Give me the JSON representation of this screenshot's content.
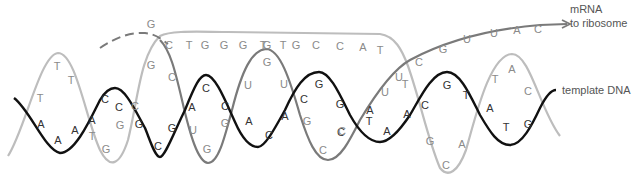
{
  "diagram": {
    "colors": {
      "coding_strand": "#b8b8b8",
      "template_strand": "#111111",
      "rna_strand": "#7a7a7a",
      "coding_text": "#8a8a8a",
      "template_text": "#333333",
      "rna_text": "#8a8a8a",
      "label_text": "#555555"
    },
    "labels": {
      "mrna_line1": "mRNA",
      "mrna_line2": "to ribosome",
      "template_dna": "template DNA"
    },
    "strands": {
      "coding_dna": {
        "name": "coding DNA strand (light grey)",
        "bases": [
          {
            "b": "T",
            "x": 40,
            "y": 98
          },
          {
            "b": "T",
            "x": 57,
            "y": 66
          },
          {
            "b": "T",
            "x": 71,
            "y": 80
          },
          {
            "b": "T",
            "x": 92,
            "y": 136
          },
          {
            "b": "G",
            "x": 106,
            "y": 149
          },
          {
            "b": "G",
            "x": 120,
            "y": 125
          },
          {
            "b": "C",
            "x": 135,
            "y": 106
          },
          {
            "b": "G",
            "x": 151,
            "y": 65
          },
          {
            "b": "G",
            "x": 151,
            "y": 24
          }
        ]
      },
      "template_dna": {
        "name": "template DNA strand (black)",
        "bases": [
          {
            "b": "A",
            "x": 41,
            "y": 124
          },
          {
            "b": "A",
            "x": 58,
            "y": 140
          },
          {
            "b": "A",
            "x": 75,
            "y": 130
          },
          {
            "b": "A",
            "x": 92,
            "y": 120
          },
          {
            "b": "C",
            "x": 105,
            "y": 99
          },
          {
            "b": "C",
            "x": 119,
            "y": 107
          },
          {
            "b": "G",
            "x": 139,
            "y": 124
          },
          {
            "b": "C",
            "x": 158,
            "y": 146
          },
          {
            "b": "G",
            "x": 172,
            "y": 128
          },
          {
            "b": "A",
            "x": 192,
            "y": 107
          },
          {
            "b": "C",
            "x": 206,
            "y": 88
          },
          {
            "b": "C",
            "x": 225,
            "y": 106
          },
          {
            "b": "A",
            "x": 249,
            "y": 121
          },
          {
            "b": "C",
            "x": 269,
            "y": 135
          },
          {
            "b": "A",
            "x": 285,
            "y": 116
          },
          {
            "b": "C",
            "x": 304,
            "y": 99
          },
          {
            "b": "G",
            "x": 319,
            "y": 84
          },
          {
            "b": "G",
            "x": 340,
            "y": 104
          },
          {
            "b": "C",
            "x": 341,
            "y": 132
          },
          {
            "b": "A",
            "x": 370,
            "y": 110
          },
          {
            "b": "T",
            "x": 369,
            "y": 121
          },
          {
            "b": "A",
            "x": 387,
            "y": 131
          },
          {
            "b": "A",
            "x": 407,
            "y": 114
          },
          {
            "b": "C",
            "x": 425,
            "y": 105
          },
          {
            "b": "G",
            "x": 447,
            "y": 85
          },
          {
            "b": "T",
            "x": 466,
            "y": 95
          },
          {
            "b": "A",
            "x": 490,
            "y": 108
          },
          {
            "b": "T",
            "x": 506,
            "y": 127
          },
          {
            "b": "G",
            "x": 528,
            "y": 124
          }
        ]
      },
      "rna_in_bubble": {
        "name": "RNA strand paired with template (medium grey)",
        "bases": [
          {
            "b": "C",
            "x": 172,
            "y": 77
          },
          {
            "b": "U",
            "x": 193,
            "y": 130
          },
          {
            "b": "G",
            "x": 207,
            "y": 149
          },
          {
            "b": "G",
            "x": 225,
            "y": 123
          },
          {
            "b": "U",
            "x": 248,
            "y": 85
          },
          {
            "b": "G",
            "x": 267,
            "y": 62
          },
          {
            "b": "U",
            "x": 284,
            "y": 84
          },
          {
            "b": "G",
            "x": 307,
            "y": 121
          },
          {
            "b": "C",
            "x": 323,
            "y": 150
          },
          {
            "b": "C",
            "x": 342,
            "y": 131
          },
          {
            "b": "U",
            "x": 385,
            "y": 92
          },
          {
            "b": "U",
            "x": 399,
            "y": 77
          },
          {
            "b": "T",
            "x": 405,
            "y": 84
          }
        ]
      },
      "coding_top": {
        "name": "non-template DNA strand running across top",
        "bases": [
          {
            "b": "C",
            "x": 169,
            "y": 45
          },
          {
            "b": "T",
            "x": 189,
            "y": 45
          },
          {
            "b": "G",
            "x": 205,
            "y": 45
          },
          {
            "b": "G",
            "x": 224,
            "y": 45
          },
          {
            "b": "G",
            "x": 243,
            "y": 45
          },
          {
            "b": "T",
            "x": 263,
            "y": 45
          },
          {
            "b": "G",
            "x": 267,
            "y": 45
          },
          {
            "b": "T",
            "x": 283,
            "y": 45
          },
          {
            "b": "G",
            "x": 296,
            "y": 45
          },
          {
            "b": "C",
            "x": 316,
            "y": 45
          },
          {
            "b": "C",
            "x": 340,
            "y": 46
          },
          {
            "b": "A",
            "x": 363,
            "y": 47
          },
          {
            "b": "T",
            "x": 380,
            "y": 50
          }
        ]
      },
      "mrna_exit": {
        "name": "mRNA leaving toward ribosome",
        "bases": [
          {
            "b": "C",
            "x": 419,
            "y": 62
          },
          {
            "b": "G",
            "x": 443,
            "y": 49
          },
          {
            "b": "U",
            "x": 467,
            "y": 39
          },
          {
            "b": "U",
            "x": 494,
            "y": 33
          },
          {
            "b": "A",
            "x": 517,
            "y": 30
          },
          {
            "b": "C",
            "x": 538,
            "y": 29
          }
        ]
      },
      "coding_right": {
        "name": "coding DNA strand re-annealed (right side, light grey)",
        "bases": [
          {
            "b": "T",
            "x": 495,
            "y": 79
          },
          {
            "b": "A",
            "x": 512,
            "y": 69
          },
          {
            "b": "C",
            "x": 528,
            "y": 91
          },
          {
            "b": "G",
            "x": 430,
            "y": 141
          },
          {
            "b": "C",
            "x": 446,
            "y": 165
          },
          {
            "b": "A",
            "x": 462,
            "y": 144
          }
        ]
      }
    }
  }
}
